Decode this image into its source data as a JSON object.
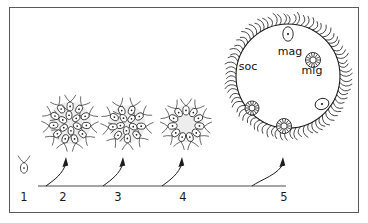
{
  "figure": {
    "background_color": "#ffffff",
    "ink_color": "#1c1c1c",
    "frame_color": "#5a5a5a",
    "frame": {
      "x": 9,
      "y": 7,
      "width": 350,
      "height": 206
    }
  },
  "timeline": {
    "axis": {
      "y": 186,
      "x_start": 38,
      "x_end": 286,
      "color": "#4a4a4a"
    },
    "stages": [
      {
        "id": "stage-1",
        "number": "1",
        "label_x": 24,
        "label_y": 201,
        "kind": "single-cell",
        "cx": 24,
        "cy": 168,
        "description": "solitary flagellated cell"
      },
      {
        "id": "stage-2",
        "number": "2",
        "label_x": 63,
        "label_y": 201,
        "kind": "colony-dense",
        "cx": 70,
        "cy": 123,
        "radius": 23,
        "cell_count": 17,
        "description": "dense rosette colony"
      },
      {
        "id": "stage-3",
        "number": "3",
        "label_x": 118,
        "label_y": 201,
        "kind": "colony-dense",
        "cx": 127,
        "cy": 124,
        "radius": 20,
        "cell_count": 14,
        "description": "rosette colony"
      },
      {
        "id": "stage-4",
        "number": "4",
        "label_x": 183,
        "label_y": 201,
        "kind": "colony-hollow",
        "cx": 186,
        "cy": 124,
        "radius": 20,
        "cell_count": 11,
        "description": "hollow ring colony"
      },
      {
        "id": "stage-5",
        "number": "5",
        "label_x": 284,
        "label_y": 201,
        "kind": "sphere",
        "cx": 288,
        "cy": 76,
        "radius": 52,
        "description": "large spherical colony with differentiated cells"
      }
    ],
    "arrows": [
      {
        "id": "arrow-1-2",
        "from_x": 46,
        "to_x": 66
      },
      {
        "id": "arrow-2-3",
        "from_x": 103,
        "to_x": 123
      },
      {
        "id": "arrow-3-4",
        "from_x": 162,
        "to_x": 182
      },
      {
        "id": "arrow-4-5",
        "from_x": 252,
        "to_x": 283
      }
    ]
  },
  "sphere": {
    "cx": 288,
    "cy": 76,
    "radius": 52,
    "cilia_count": 78,
    "cilia_length": 11,
    "labels": [
      {
        "id": "label-soc",
        "text": "soc",
        "x": 248,
        "y": 70,
        "meaning": "somatic cells"
      },
      {
        "id": "label-mag",
        "text": "mag",
        "x": 290,
        "y": 55,
        "meaning": "macrogamete"
      },
      {
        "id": "label-mig",
        "text": "mig",
        "x": 312,
        "y": 74,
        "meaning": "microgamete"
      }
    ],
    "inner_cells": [
      {
        "id": "inner-mag-top",
        "type": "macrogamete",
        "cx": 288,
        "cy": 34,
        "rx": 5.2,
        "ry": 7.2,
        "rot": 0
      },
      {
        "id": "inner-mig-right",
        "type": "microgamete",
        "cx": 313,
        "cy": 60,
        "r": 7.5
      },
      {
        "id": "inner-mag-right",
        "type": "macrogamete",
        "cx": 322,
        "cy": 104,
        "rx": 7,
        "ry": 5.5,
        "rot": -18
      },
      {
        "id": "inner-mig-left",
        "type": "microgamete",
        "cx": 252,
        "cy": 108,
        "r": 7
      },
      {
        "id": "inner-mig-bottom",
        "type": "microgamete",
        "cx": 284,
        "cy": 126,
        "r": 7.5
      }
    ]
  }
}
